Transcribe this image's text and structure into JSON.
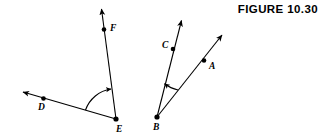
{
  "figure": {
    "title": "FIGURE  10.30",
    "background_color": "#ffffff",
    "ink_color": "#000000",
    "width": 322,
    "height": 138
  },
  "diagram": {
    "angles": [
      {
        "name": "angle-DEF",
        "vertex_label": "E",
        "ray_labels": [
          "D",
          "F"
        ],
        "arc_direction": "counterclockwise"
      },
      {
        "name": "angle-ABC",
        "vertex_label": "B",
        "ray_labels": [
          "A",
          "C"
        ],
        "arc_direction": "counterclockwise"
      }
    ],
    "labels": {
      "A": "A",
      "B": "B",
      "C": "C",
      "D": "D",
      "E": "E",
      "F": "F"
    }
  }
}
